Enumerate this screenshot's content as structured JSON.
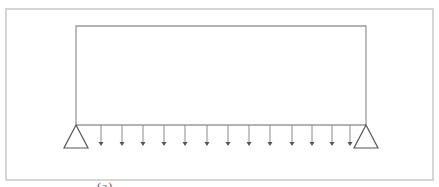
{
  "diagram": {
    "type": "structural-frame",
    "colors": {
      "outer_border": "#c8c8c8",
      "frame": "#9a9a9a",
      "arrow": "#555555",
      "support": "#555555"
    },
    "outer_box": {
      "x": 6,
      "y": 9,
      "width": 427,
      "height": 171
    },
    "frame": {
      "left_x": 76,
      "right_x": 366,
      "top_y": 26,
      "beam_y": 125
    },
    "supports": [
      {
        "name": "left-pin-support",
        "apex_x": 76,
        "apex_y": 125,
        "half_width": 12,
        "height": 23
      },
      {
        "name": "right-pin-support",
        "apex_x": 366,
        "apex_y": 125,
        "half_width": 12,
        "height": 23
      }
    ],
    "load_arrows": {
      "count": 13,
      "x_positions": [
        101,
        122,
        143,
        164,
        185,
        207,
        228,
        249,
        270,
        292,
        312,
        332,
        350
      ],
      "top_y": 125,
      "tip_y": 146
    },
    "caption": "(a)"
  }
}
